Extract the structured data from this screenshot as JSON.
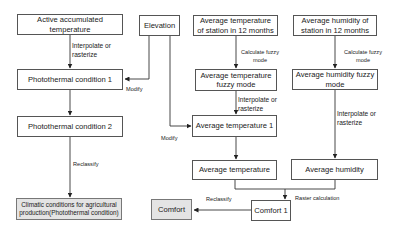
{
  "diagram": {
    "type": "flowchart",
    "nodes": {
      "active_accumulated_temperature": "Active accumulated temperature",
      "elevation": "Elevation",
      "avg_temp_station": "Average temperature of station in 12 months",
      "avg_humidity_station": "Average humidity of station in 12 months",
      "photothermal_1": "Photothermal condition 1",
      "photothermal_2": "Photothermal condition 2",
      "climatic_conditions": "Climatic conditions for agricultural production(Photothermal condition)",
      "avg_temp_fuzzy": "Average temperature fuzzy mode",
      "avg_humidity_fuzzy": "Average humidity fuzzy mode",
      "avg_temp_1": "Average temperature 1",
      "avg_temp": "Average temperature",
      "avg_humidity": "Average humidity",
      "comfort_1": "Comfort 1",
      "comfort": "Comfort"
    },
    "edge_labels": {
      "interpolate_1": "Interpolate or rasterize",
      "modify_1": "Modify",
      "reclassify_1": "Reclassify",
      "calc_fuzzy_temp": "Calculate fuzzy mode",
      "calc_fuzzy_hum": "Calculate fuzzy mode",
      "interpolate_temp": "Interpolate or rasterize",
      "interpolate_hum": "Interpolate or rasterize",
      "modify_2": "Modify",
      "raster_calc": "Raster calculation",
      "reclassify_2": "Reclassify"
    },
    "edges": [
      {
        "from": "active_accumulated_temperature",
        "to": "photothermal_1",
        "label": "Interpolate or rasterize"
      },
      {
        "from": "elevation",
        "to": "photothermal_1",
        "label": "Modify"
      },
      {
        "from": "photothermal_1",
        "to": "photothermal_2",
        "label": ""
      },
      {
        "from": "photothermal_2",
        "to": "climatic_conditions",
        "label": "Reclassify"
      },
      {
        "from": "avg_temp_station",
        "to": "avg_temp_fuzzy",
        "label": "Calculate fuzzy mode"
      },
      {
        "from": "avg_temp_fuzzy",
        "to": "avg_temp_1",
        "label": "Interpolate or rasterize"
      },
      {
        "from": "elevation",
        "to": "avg_temp_1",
        "label": "Modify"
      },
      {
        "from": "avg_temp_1",
        "to": "avg_temp",
        "label": ""
      },
      {
        "from": "avg_humidity_station",
        "to": "avg_humidity_fuzzy",
        "label": "Calculate fuzzy mode"
      },
      {
        "from": "avg_humidity_fuzzy",
        "to": "avg_humidity",
        "label": "Interpolate or rasterize"
      },
      {
        "from": "avg_temp",
        "to": "comfort_1",
        "label": "Raster calculation"
      },
      {
        "from": "avg_humidity",
        "to": "comfort_1",
        "label": "Raster calculation"
      },
      {
        "from": "comfort_1",
        "to": "comfort",
        "label": "Reclassify"
      }
    ],
    "colors": {
      "line": "#333333",
      "node_border": "#555555",
      "output_fill": "#e4e4e4"
    }
  }
}
